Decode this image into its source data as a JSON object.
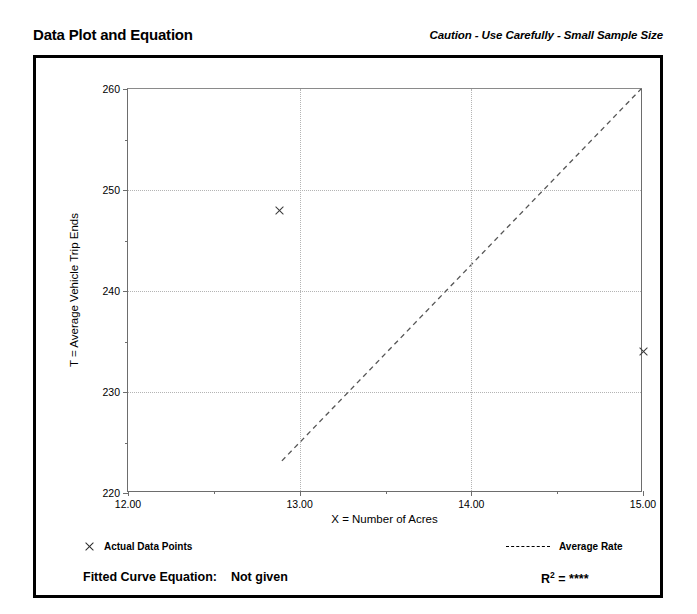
{
  "header": {
    "title": "Data Plot and Equation",
    "caution": "Caution - Use Carefully - Small Sample Size"
  },
  "legend": {
    "data_points_label": "Actual Data Points",
    "average_rate_label": "Average Rate",
    "data_points_marker": "x-marker-icon",
    "average_rate_marker": "dashed-line-icon"
  },
  "footer": {
    "equation_label": "Fitted Curve Equation:",
    "equation_value": "Not given",
    "r_squared_label": "R",
    "r_squared_exponent": "2",
    "r_squared_equals": "=",
    "r_squared_value": "****"
  },
  "colors": {
    "frame": "#000000",
    "axis": "#6d6d6d",
    "grid": "#b4b4b4",
    "marker": "#3a3a3a",
    "trend": "#555555",
    "text": "#000000"
  },
  "chart_data": {
    "type": "scatter",
    "title": "Data Plot and Equation",
    "subtitle": "Caution - Use Carefully - Small Sample Size",
    "xlabel": "X = Number of Acres",
    "ylabel": "T = Average Vehicle Trip Ends",
    "xlim": [
      12.0,
      15.0
    ],
    "ylim": [
      220,
      260
    ],
    "xticks": [
      12.0,
      13.0,
      14.0,
      15.0
    ],
    "xticklabels": [
      "12.00",
      "13.00",
      "14.00",
      "15.00"
    ],
    "xminorticks": [
      12.5,
      13.5,
      14.5
    ],
    "yticks": [
      220,
      230,
      240,
      250,
      260
    ],
    "yticklabels": [
      "220",
      "230",
      "240",
      "250",
      "260"
    ],
    "yminorticks": [
      225,
      235,
      245,
      255
    ],
    "grid": true,
    "grid_style": "dotted",
    "legend_position": "below-plot",
    "series": [
      {
        "name": "Actual Data Points",
        "type": "scatter",
        "marker": "x",
        "points": [
          {
            "x": 12.88,
            "y": 248
          },
          {
            "x": 15.0,
            "y": 234
          }
        ]
      },
      {
        "name": "Average Rate",
        "type": "line",
        "style": "dashed",
        "points": [
          {
            "x": 12.9,
            "y": 223
          },
          {
            "x": 15.0,
            "y": 260
          }
        ]
      }
    ],
    "annotations": {
      "fitted_curve_equation": "Not given",
      "r_squared": "****"
    }
  }
}
